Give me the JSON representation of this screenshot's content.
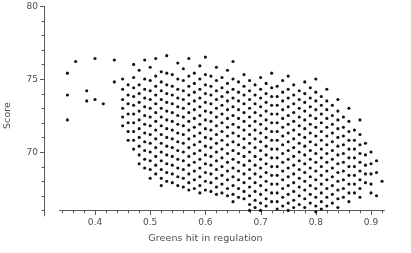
{
  "chart_data": {
    "type": "scatter",
    "title": "",
    "xlabel": "Greens hit in regulation",
    "ylabel": "Score",
    "xlim": [
      0.325,
      0.925
    ],
    "ylim": [
      65.2,
      80.0
    ],
    "grid": false,
    "legend": null,
    "xticks": [
      0.4,
      0.5,
      0.6,
      0.7,
      0.8,
      0.9
    ],
    "xtick_labels": [
      "0.4",
      "0.5",
      "0.6",
      "0.7",
      "0.8",
      "0.9"
    ],
    "xminor_step": 0.02,
    "yticks": [
      70,
      75,
      80
    ],
    "ytick_labels": [
      "70",
      "75",
      "80"
    ],
    "yminor_step": 1,
    "marker": "filled-circle",
    "marker_size_px": 3.1,
    "marker_color": "#111111",
    "axis_color": "#595959",
    "columns": [
      {
        "x": 0.35,
        "values": [
          75.4,
          73.9,
          72.2
        ]
      },
      {
        "x": 0.365,
        "values": [
          76.2
        ]
      },
      {
        "x": 0.385,
        "values": [
          74.2,
          73.5
        ]
      },
      {
        "x": 0.4,
        "values": [
          76.4,
          73.6
        ]
      },
      {
        "x": 0.415,
        "values": [
          73.3
        ]
      },
      {
        "x": 0.435,
        "values": [
          76.3,
          74.8
        ]
      },
      {
        "x": 0.45,
        "values": [
          75.0,
          74.3,
          73.6,
          73.0,
          72.4,
          71.8
        ]
      },
      {
        "x": 0.46,
        "values": [
          74.6,
          73.9,
          73.3,
          72.6,
          72.0,
          71.4,
          70.8
        ]
      },
      {
        "x": 0.47,
        "values": [
          76.0,
          75.1,
          74.4,
          73.8,
          73.2,
          72.6,
          72.0,
          71.4,
          70.8,
          70.2
        ]
      },
      {
        "x": 0.48,
        "values": [
          75.6,
          74.6,
          74.0,
          73.4,
          72.8,
          72.2,
          71.6,
          71.0,
          70.4,
          69.8,
          69.2
        ]
      },
      {
        "x": 0.49,
        "values": [
          76.3,
          75.0,
          74.3,
          73.7,
          73.1,
          72.5,
          71.9,
          71.3,
          70.7,
          70.1,
          69.5,
          68.9
        ]
      },
      {
        "x": 0.5,
        "values": [
          75.8,
          74.9,
          74.2,
          73.6,
          73.0,
          72.4,
          71.8,
          71.2,
          70.6,
          70.0,
          69.4,
          68.8,
          68.2
        ]
      },
      {
        "x": 0.51,
        "values": [
          76.4,
          75.2,
          74.5,
          73.9,
          73.3,
          72.7,
          72.1,
          71.5,
          70.9,
          70.3,
          69.7,
          69.1,
          68.5
        ]
      },
      {
        "x": 0.52,
        "values": [
          75.5,
          74.8,
          74.2,
          73.6,
          73.0,
          72.4,
          71.8,
          71.2,
          70.6,
          70.0,
          69.4,
          68.8,
          68.2,
          67.7
        ]
      },
      {
        "x": 0.53,
        "values": [
          76.6,
          75.4,
          74.6,
          74.0,
          73.4,
          72.8,
          72.2,
          71.6,
          71.0,
          70.4,
          69.8,
          69.2,
          68.6,
          68.0
        ]
      },
      {
        "x": 0.54,
        "values": [
          75.3,
          74.5,
          73.9,
          73.3,
          72.7,
          72.1,
          71.5,
          70.9,
          70.3,
          69.7,
          69.1,
          68.5,
          67.9
        ]
      },
      {
        "x": 0.55,
        "values": [
          76.1,
          75.0,
          74.3,
          73.7,
          73.1,
          72.5,
          71.9,
          71.3,
          70.7,
          70.1,
          69.5,
          68.9,
          68.3,
          67.7
        ]
      },
      {
        "x": 0.56,
        "values": [
          75.7,
          74.9,
          74.2,
          73.6,
          73.0,
          72.4,
          71.8,
          71.2,
          70.6,
          70.0,
          69.4,
          68.8,
          68.2,
          67.6
        ]
      },
      {
        "x": 0.57,
        "values": [
          76.4,
          75.2,
          74.5,
          73.9,
          73.3,
          72.7,
          72.1,
          71.5,
          70.9,
          70.3,
          69.7,
          69.1,
          68.5,
          67.9,
          67.4
        ]
      },
      {
        "x": 0.58,
        "values": [
          75.4,
          74.7,
          74.1,
          73.5,
          72.9,
          72.3,
          71.7,
          71.1,
          70.5,
          69.9,
          69.3,
          68.7,
          68.1,
          67.5
        ]
      },
      {
        "x": 0.59,
        "values": [
          75.9,
          75.0,
          74.3,
          73.7,
          73.1,
          72.5,
          71.9,
          71.3,
          70.7,
          70.1,
          69.5,
          68.9,
          68.3,
          67.7,
          67.2
        ]
      },
      {
        "x": 0.6,
        "values": [
          76.5,
          75.3,
          74.6,
          74.0,
          73.4,
          72.8,
          72.2,
          71.6,
          71.0,
          70.4,
          69.8,
          69.2,
          68.6,
          68.0,
          67.4
        ]
      },
      {
        "x": 0.61,
        "values": [
          75.2,
          74.5,
          73.9,
          73.3,
          72.7,
          72.1,
          71.5,
          70.9,
          70.3,
          69.7,
          69.1,
          68.5,
          67.9,
          67.3
        ]
      },
      {
        "x": 0.62,
        "values": [
          75.8,
          74.9,
          74.2,
          73.6,
          73.0,
          72.4,
          71.8,
          71.2,
          70.6,
          70.0,
          69.4,
          68.8,
          68.2,
          67.6,
          67.1
        ]
      },
      {
        "x": 0.63,
        "values": [
          75.1,
          74.4,
          73.8,
          73.2,
          72.6,
          72.0,
          71.4,
          70.8,
          70.2,
          69.6,
          69.0,
          68.4,
          67.8,
          67.2
        ]
      },
      {
        "x": 0.64,
        "values": [
          75.6,
          74.7,
          74.1,
          73.5,
          72.9,
          72.3,
          71.7,
          71.1,
          70.5,
          69.9,
          69.3,
          68.7,
          68.1,
          67.5,
          67.0
        ]
      },
      {
        "x": 0.65,
        "values": [
          76.2,
          75.0,
          74.3,
          73.7,
          73.1,
          72.5,
          71.9,
          71.3,
          70.7,
          70.1,
          69.5,
          68.9,
          68.3,
          67.7,
          67.1,
          66.6
        ]
      },
      {
        "x": 0.66,
        "values": [
          74.8,
          74.1,
          73.5,
          72.9,
          72.3,
          71.7,
          71.1,
          70.5,
          69.9,
          69.3,
          68.7,
          68.1,
          67.5,
          66.9
        ]
      },
      {
        "x": 0.67,
        "values": [
          75.3,
          74.5,
          73.9,
          73.3,
          72.7,
          72.1,
          71.5,
          70.9,
          70.3,
          69.7,
          69.1,
          68.5,
          67.9,
          67.3,
          66.8
        ]
      },
      {
        "x": 0.68,
        "values": [
          74.9,
          74.2,
          73.6,
          73.0,
          72.4,
          71.8,
          71.2,
          70.6,
          70.0,
          69.4,
          68.8,
          68.2,
          67.6,
          67.0,
          66.4,
          66.0
        ]
      },
      {
        "x": 0.69,
        "values": [
          74.6,
          73.9,
          73.3,
          72.7,
          72.1,
          71.5,
          70.9,
          70.3,
          69.7,
          69.1,
          68.5,
          67.9,
          67.3,
          66.7,
          66.2
        ]
      },
      {
        "x": 0.7,
        "values": [
          75.1,
          74.3,
          73.7,
          73.1,
          72.5,
          71.9,
          71.3,
          70.7,
          70.1,
          69.5,
          68.9,
          68.3,
          67.7,
          67.1,
          66.5,
          66.0
        ]
      },
      {
        "x": 0.71,
        "values": [
          74.7,
          74.0,
          73.4,
          72.8,
          72.2,
          71.6,
          71.0,
          70.4,
          69.8,
          69.2,
          68.6,
          68.0,
          67.4,
          66.8,
          66.3
        ]
      },
      {
        "x": 0.72,
        "values": [
          75.4,
          74.4,
          73.8,
          73.2,
          72.6,
          72.0,
          71.4,
          70.8,
          70.2,
          69.6,
          69.0,
          68.4,
          67.8,
          67.2,
          66.6
        ]
      },
      {
        "x": 0.73,
        "values": [
          74.5,
          73.8,
          73.2,
          72.6,
          72.0,
          71.4,
          70.8,
          70.2,
          69.6,
          69.0,
          68.4,
          67.8,
          67.2,
          66.6,
          66.1
        ]
      },
      {
        "x": 0.74,
        "values": [
          74.9,
          74.1,
          73.5,
          72.9,
          72.3,
          71.7,
          71.1,
          70.5,
          69.9,
          69.3,
          68.7,
          68.1,
          67.5,
          66.9,
          66.3
        ]
      },
      {
        "x": 0.75,
        "values": [
          75.2,
          74.3,
          73.7,
          73.1,
          72.5,
          71.9,
          71.3,
          70.7,
          70.1,
          69.5,
          68.9,
          68.3,
          67.7,
          67.1,
          66.5,
          66.0
        ]
      },
      {
        "x": 0.76,
        "values": [
          74.6,
          73.9,
          73.3,
          72.7,
          72.1,
          71.5,
          70.9,
          70.3,
          69.7,
          69.1,
          68.5,
          67.9,
          67.3,
          66.7,
          66.2
        ]
      },
      {
        "x": 0.77,
        "values": [
          74.2,
          73.6,
          73.0,
          72.4,
          71.8,
          71.2,
          70.6,
          70.0,
          69.4,
          68.8,
          68.2,
          67.6,
          67.0,
          66.4
        ]
      },
      {
        "x": 0.78,
        "values": [
          74.8,
          74.0,
          73.4,
          72.8,
          72.2,
          71.6,
          71.0,
          70.4,
          69.8,
          69.2,
          68.6,
          68.0,
          67.4,
          66.8,
          66.2
        ]
      },
      {
        "x": 0.79,
        "values": [
          74.4,
          73.7,
          73.1,
          72.5,
          71.9,
          71.3,
          70.7,
          70.1,
          69.5,
          68.9,
          68.3,
          67.7,
          67.1,
          66.5
        ]
      },
      {
        "x": 0.8,
        "values": [
          75.0,
          74.1,
          73.5,
          72.9,
          72.3,
          71.7,
          71.1,
          70.5,
          69.9,
          69.3,
          68.7,
          68.1,
          67.5,
          66.9,
          66.3,
          65.9
        ]
      },
      {
        "x": 0.81,
        "values": [
          73.8,
          73.2,
          72.6,
          72.0,
          71.4,
          70.8,
          70.2,
          69.6,
          69.0,
          68.4,
          67.8,
          67.2,
          66.6,
          66.1
        ]
      },
      {
        "x": 0.82,
        "values": [
          74.3,
          73.5,
          72.9,
          72.3,
          71.7,
          71.1,
          70.5,
          69.9,
          69.3,
          68.7,
          68.1,
          67.5,
          66.9,
          66.3
        ]
      },
      {
        "x": 0.83,
        "values": [
          73.2,
          72.5,
          71.9,
          71.3,
          70.7,
          70.1,
          69.5,
          68.9,
          68.3,
          67.7,
          67.1,
          66.5
        ]
      },
      {
        "x": 0.84,
        "values": [
          73.6,
          72.8,
          72.2,
          71.6,
          71.0,
          70.4,
          69.8,
          69.2,
          68.6,
          68.0,
          67.4,
          66.8,
          66.2
        ]
      },
      {
        "x": 0.85,
        "values": [
          72.4,
          71.7,
          71.1,
          70.5,
          69.9,
          69.3,
          68.7,
          68.1,
          67.5,
          66.9
        ]
      },
      {
        "x": 0.86,
        "values": [
          73.0,
          72.1,
          71.4,
          70.8,
          70.2,
          69.6,
          69.0,
          68.4,
          67.8,
          67.2,
          66.6
        ]
      },
      {
        "x": 0.87,
        "values": [
          71.5,
          70.8,
          70.2,
          69.6,
          69.0,
          68.4,
          67.8,
          67.2
        ]
      },
      {
        "x": 0.88,
        "values": [
          72.2,
          71.2,
          70.5,
          69.9,
          69.3,
          68.7,
          68.1,
          67.5,
          66.9
        ]
      },
      {
        "x": 0.89,
        "values": [
          70.6,
          69.8,
          69.1,
          68.5,
          67.9
        ]
      },
      {
        "x": 0.9,
        "values": [
          70.0,
          69.2,
          68.5,
          67.8,
          67.2
        ]
      },
      {
        "x": 0.91,
        "values": [
          69.4,
          68.6,
          67.0
        ]
      },
      {
        "x": 0.92,
        "values": [
          68.0
        ]
      }
    ]
  }
}
